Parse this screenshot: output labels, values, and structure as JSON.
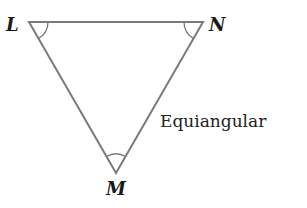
{
  "diagram": {
    "type": "triangle",
    "vertices": [
      {
        "name": "L",
        "x": 29,
        "y": 22
      },
      {
        "name": "N",
        "x": 203,
        "y": 22
      },
      {
        "name": "M",
        "x": 116,
        "y": 173
      }
    ],
    "labels": {
      "L": "L",
      "N": "N",
      "M": "M"
    },
    "caption": "Equiangular",
    "angle_marks": [
      "L",
      "N",
      "M"
    ],
    "colors": {
      "stroke": "#7a7a7a",
      "text": "#1a1a1a"
    }
  }
}
